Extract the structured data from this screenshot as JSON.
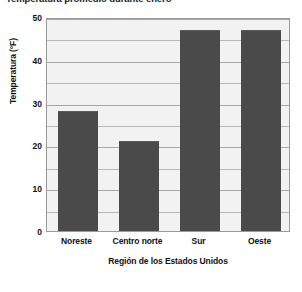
{
  "chart_data": {
    "type": "bar",
    "title": "Temperatura promedio durante enero",
    "xlabel": "Región de los Estados Unidos",
    "ylabel": "Temperatura (°F)",
    "categories": [
      "Noreste",
      "Centro norte",
      "Sur",
      "Oeste"
    ],
    "values": [
      28,
      21,
      47,
      47
    ],
    "ylim": [
      0,
      50
    ],
    "yticks": [
      0,
      10,
      20,
      30,
      40,
      50
    ],
    "ytick_labels": [
      "0",
      "10",
      "20",
      "30",
      "40",
      "50"
    ],
    "minor_tick_step": 5,
    "grid": true,
    "legend": null,
    "bar_color": "#4a4a4a",
    "plot_background": "#f2f2f2",
    "grid_color": "#b8b8b8",
    "frame_color": "#9a9a9a"
  }
}
